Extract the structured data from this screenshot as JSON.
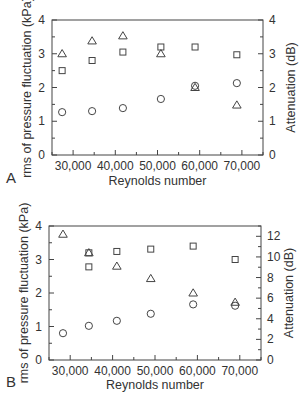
{
  "chart_data": [
    {
      "panel": "A",
      "type": "scatter",
      "title": "",
      "xlabel": "Reynolds number",
      "ylabel": "rms of pressure fluctuation (kPa)",
      "y2label": "Attenuation (dB)",
      "xlim": [
        25000,
        75000
      ],
      "ylim": [
        0,
        4
      ],
      "y2lim": [
        0,
        4
      ],
      "xticks": [
        30000,
        40000,
        50000,
        60000,
        70000
      ],
      "xtick_labels": [
        "30,000",
        "40,000",
        "50,000",
        "60,000",
        "70,000"
      ],
      "yticks": [
        0,
        1,
        2,
        3,
        4
      ],
      "ytick_labels": [
        "0",
        "1",
        "2",
        "3",
        "4"
      ],
      "y2ticks": [
        0,
        1,
        2,
        3,
        4
      ],
      "y2tick_labels": [
        "0",
        "1",
        "2",
        "3",
        "4"
      ],
      "grid": false,
      "legend": "none",
      "series": [
        {
          "name": "circle",
          "marker": "circle",
          "axis": "left",
          "x": [
            27400,
            34500,
            41800,
            50800,
            58900,
            68800
          ],
          "values": [
            1.27,
            1.3,
            1.39,
            1.66,
            2.05,
            2.13
          ]
        },
        {
          "name": "square",
          "marker": "square",
          "axis": "left",
          "x": [
            27400,
            34500,
            41800,
            50800,
            58900,
            68800
          ],
          "values": [
            2.5,
            2.8,
            3.05,
            3.2,
            3.2,
            2.97
          ]
        },
        {
          "name": "triangle",
          "marker": "triangle",
          "axis": "right",
          "x": [
            27400,
            34500,
            41800,
            50800,
            58900,
            68800
          ],
          "values": [
            3.0,
            3.38,
            3.53,
            3.0,
            2.0,
            1.48
          ]
        }
      ]
    },
    {
      "panel": "B",
      "type": "scatter",
      "title": "",
      "xlabel": "Reynolds number",
      "ylabel": "rms of pressure fluctuation (kPa)",
      "y2label": "Attenuation (dB)",
      "xlim": [
        25000,
        75000
      ],
      "ylim": [
        0,
        4
      ],
      "y2lim": [
        0,
        13
      ],
      "xticks": [
        30000,
        40000,
        50000,
        60000,
        70000
      ],
      "xtick_labels": [
        "30,000",
        "40,000",
        "50,000",
        "60,000",
        "70,000"
      ],
      "yticks": [
        0,
        1,
        2,
        3,
        4
      ],
      "ytick_labels": [
        "0",
        "1",
        "2",
        "3",
        "4"
      ],
      "y2ticks": [
        0,
        2,
        4,
        6,
        8,
        10,
        12
      ],
      "y2tick_labels": [
        "0",
        "2",
        "4",
        "6",
        "8",
        "10",
        "12"
      ],
      "grid": false,
      "legend": "none",
      "series": [
        {
          "name": "circle",
          "marker": "circle",
          "axis": "left",
          "x": [
            28300,
            34400,
            41000,
            49000,
            59000,
            68900
          ],
          "values": [
            0.8,
            1.02,
            1.17,
            1.38,
            1.66,
            1.62
          ]
        },
        {
          "name": "square",
          "marker": "square",
          "axis": "left",
          "x": [
            34400,
            34400,
            41000,
            49000,
            59000,
            68900
          ],
          "values": [
            3.2,
            2.78,
            3.24,
            3.31,
            3.4,
            3.0
          ]
        },
        {
          "name": "triangle",
          "marker": "triangle",
          "axis": "right",
          "x": [
            28300,
            34400,
            41000,
            49000,
            59000,
            68900
          ],
          "values": [
            12.2,
            10.4,
            9.1,
            7.9,
            6.5,
            5.6
          ]
        }
      ]
    }
  ],
  "panels": [
    {
      "letter": "A",
      "plot": {
        "left": 52,
        "right": 263,
        "top": 20,
        "bottom": 155
      },
      "letter_pos": [
        6,
        183
      ],
      "xlabel_y": 185
    },
    {
      "letter": "B",
      "plot": {
        "left": 49,
        "right": 261,
        "top": 226,
        "bottom": 360
      },
      "letter_pos": [
        6,
        387
      ],
      "xlabel_y": 389
    }
  ]
}
